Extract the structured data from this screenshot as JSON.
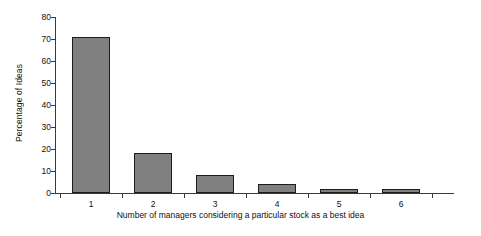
{
  "chart_data": {
    "type": "bar",
    "title": "",
    "subtitle": "",
    "xlabel": "Number of managers considering a particular stock as a best idea",
    "ylabel": "Percentage of Ideas",
    "categories": [
      "1",
      "2",
      "3",
      "4",
      "5",
      "6"
    ],
    "values": [
      71,
      18,
      8,
      4,
      2,
      2
    ],
    "series": [
      {
        "name": "Percentage of Ideas",
        "values": [
          71,
          18,
          8,
          4,
          2,
          2
        ]
      }
    ],
    "ylim": [
      0,
      80
    ],
    "yticks": [
      0,
      10,
      20,
      30,
      40,
      50,
      60,
      70,
      80
    ],
    "ytick_labels": [
      "0",
      "10",
      "20",
      "30",
      "40",
      "50",
      "60",
      "70",
      "80"
    ],
    "xtick_labels": [
      "1",
      "2",
      "3",
      "4",
      "5",
      "6"
    ],
    "grid": false,
    "legend": false,
    "legend_position": "none",
    "bar_color": "#808080",
    "bar_edge_color": "#1c1c1c",
    "axis_color": "#3a3a3a",
    "background_color": "#ffffff",
    "annotations": []
  }
}
